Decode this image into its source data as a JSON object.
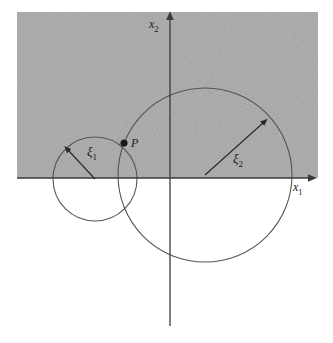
{
  "figure": {
    "background_color": "#ffffff",
    "shaded_region_color": "#a8a8a8",
    "line_color": "#4a4a4a",
    "axis_color": "#3a3a3a",
    "text_color": "#1a1a1a"
  },
  "axes": {
    "horizontal": {
      "name": "x1-axis",
      "label_base": "x",
      "label_sub": "1",
      "y_position": 178,
      "x_start": 17,
      "x_end": 316,
      "label_x": 293,
      "label_y": 191
    },
    "vertical": {
      "name": "x2-axis",
      "label_base": "x",
      "label_sub": "2",
      "x_position": 170,
      "y_top": 12,
      "y_bottom": 326,
      "label_x": 149,
      "label_y": 28
    }
  },
  "shaded_region": {
    "name": "upper-half-plane",
    "x": 17,
    "y": 12,
    "width": 301,
    "height": 166,
    "fill": "#a8a8a8"
  },
  "circles": [
    {
      "name": "circle-xi1",
      "cx": 95,
      "cy": 179,
      "r": 42,
      "radius_label_base": "ξ",
      "radius_label_sub": "1",
      "radius_label_x": 87,
      "radius_label_y": 156,
      "arrow_from_x": 95,
      "arrow_from_y": 179,
      "arrow_to_x": 66,
      "arrow_to_y": 148
    },
    {
      "name": "circle-xi2",
      "cx": 205,
      "cy": 175,
      "r": 87,
      "radius_label_base": "ξ",
      "radius_label_sub": "2",
      "radius_label_x": 233,
      "radius_label_y": 163,
      "arrow_from_x": 205,
      "arrow_from_y": 175,
      "arrow_to_x": 266,
      "arrow_to_y": 120
    }
  ],
  "points": [
    {
      "name": "point-P",
      "label": "P",
      "cx": 124,
      "cy": 143,
      "r": 3.6,
      "label_x": 131,
      "label_y": 142
    }
  ]
}
